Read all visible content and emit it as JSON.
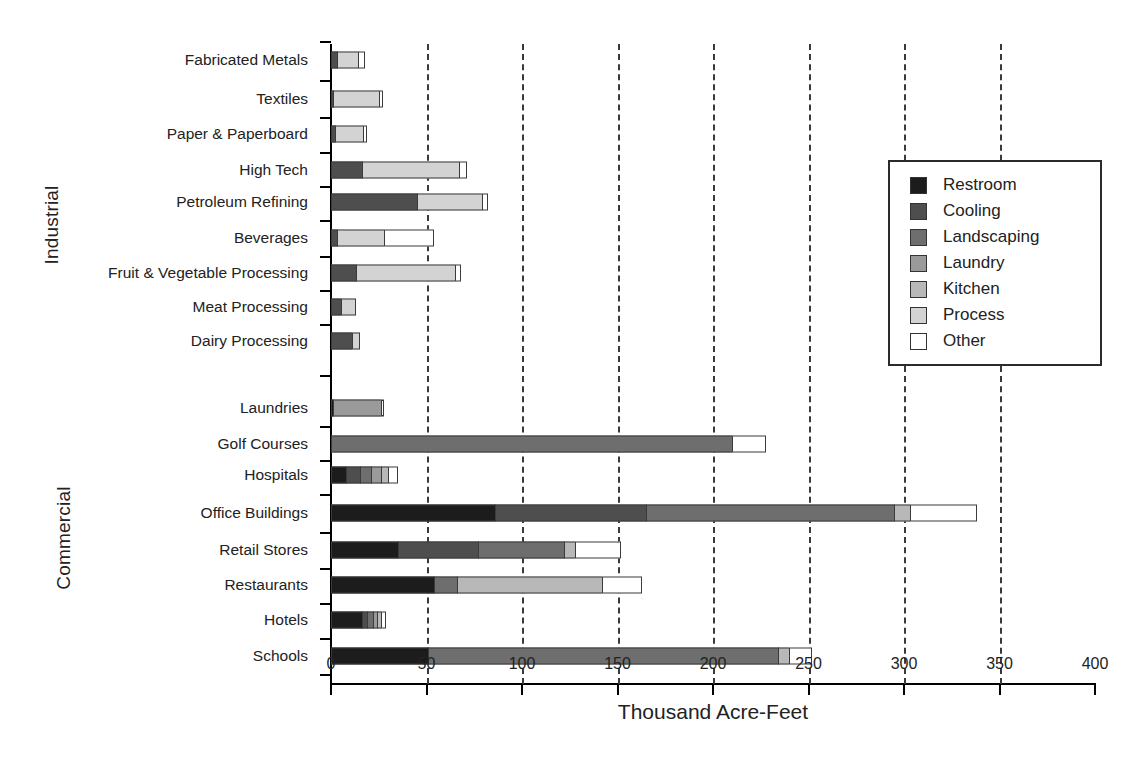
{
  "chart": {
    "type": "bar",
    "orientation": "horizontal",
    "stacked": true,
    "xlabel": "Thousand Acre-Feet",
    "ylabel": "",
    "title": "",
    "grid": "vertical-dashed",
    "legend_position": "upper-right"
  },
  "axis": {
    "x_ticks": [
      "0",
      "50",
      "100",
      "150",
      "200",
      "250",
      "300",
      "350",
      "400"
    ],
    "x_values": [
      0,
      50,
      100,
      150,
      200,
      250,
      300,
      350,
      400
    ],
    "xlim": [
      0,
      400
    ],
    "x_title": "Thousand Acre-Feet"
  },
  "groups": [
    {
      "name": "industrial",
      "label": "Industrial"
    },
    {
      "name": "commercial",
      "label": "Commercial"
    }
  ],
  "legend": {
    "items": [
      {
        "label": "Restroom",
        "color": "#1c1c1c"
      },
      {
        "label": "Cooling",
        "color": "#4e4e4e"
      },
      {
        "label": "Landscaping",
        "color": "#6e6e6e"
      },
      {
        "label": "Laundry",
        "color": "#9a9a9a"
      },
      {
        "label": "Kitchen",
        "color": "#b8b8b8"
      },
      {
        "label": "Process",
        "color": "#d3d3d3"
      },
      {
        "label": "Other",
        "color": "#ffffff"
      }
    ]
  },
  "chart_data": {
    "type": "bar",
    "orientation": "horizontal",
    "stacked": true,
    "title": "",
    "xlabel": "Thousand Acre-Feet",
    "ylabel": "",
    "xlim": [
      0,
      400
    ],
    "xticks": [
      0,
      50,
      100,
      150,
      200,
      250,
      300,
      350,
      400
    ],
    "grid": true,
    "legend_position": "upper right",
    "series": [
      {
        "name": "Restroom",
        "color": "#1c1c1c"
      },
      {
        "name": "Cooling",
        "color": "#4e4e4e"
      },
      {
        "name": "Landscaping",
        "color": "#6e6e6e"
      },
      {
        "name": "Laundry",
        "color": "#9a9a9a"
      },
      {
        "name": "Kitchen",
        "color": "#b8b8b8"
      },
      {
        "name": "Process",
        "color": "#d3d3d3"
      },
      {
        "name": "Other",
        "color": "#ffffff"
      }
    ],
    "categories": [
      "Fabricated Metals",
      "Textiles",
      "Paper & Paperboard",
      "High Tech",
      "Petroleum Refining",
      "Beverages",
      "Fruit & Vegetable Processing",
      "Meat Processing",
      "Dairy Processing",
      "Laundries",
      "Golf Courses",
      "Hospitals",
      "Office Buildings",
      "Retail Stores",
      "Restaurants",
      "Hotels",
      "Schools"
    ],
    "group_of_category": [
      "Industrial",
      "Industrial",
      "Industrial",
      "Industrial",
      "Industrial",
      "Industrial",
      "Industrial",
      "Industrial",
      "Industrial",
      "Commercial",
      "Commercial",
      "Commercial",
      "Commercial",
      "Commercial",
      "Commercial",
      "Commercial",
      "Commercial"
    ],
    "values": {
      "Fabricated Metals": {
        "Restroom": 0,
        "Cooling": 3,
        "Landscaping": 0,
        "Laundry": 0,
        "Kitchen": 0,
        "Process": 11,
        "Other": 4
      },
      "Textiles": {
        "Restroom": 0,
        "Cooling": 1,
        "Landscaping": 0,
        "Laundry": 0,
        "Kitchen": 0,
        "Process": 24,
        "Other": 2
      },
      "Paper & Paperboard": {
        "Restroom": 0,
        "Cooling": 2,
        "Landscaping": 0,
        "Laundry": 0,
        "Kitchen": 0,
        "Process": 15,
        "Other": 2
      },
      "High Tech": {
        "Restroom": 0,
        "Cooling": 16,
        "Landscaping": 0,
        "Laundry": 0,
        "Kitchen": 0,
        "Process": 51,
        "Other": 4
      },
      "Petroleum Refining": {
        "Restroom": 0,
        "Cooling": 45,
        "Landscaping": 0,
        "Laundry": 0,
        "Kitchen": 0,
        "Process": 34,
        "Other": 3
      },
      "Beverages": {
        "Restroom": 0,
        "Cooling": 3,
        "Landscaping": 0,
        "Laundry": 0,
        "Kitchen": 0,
        "Process": 25,
        "Other": 26
      },
      "Fruit & Vegetable Processing": {
        "Restroom": 0,
        "Cooling": 13,
        "Landscaping": 0,
        "Laundry": 0,
        "Kitchen": 0,
        "Process": 52,
        "Other": 3
      },
      "Meat Processing": {
        "Restroom": 0,
        "Cooling": 5,
        "Landscaping": 0,
        "Laundry": 0,
        "Kitchen": 0,
        "Process": 8,
        "Other": 0
      },
      "Dairy Processing": {
        "Restroom": 0,
        "Cooling": 11,
        "Landscaping": 0,
        "Laundry": 0,
        "Kitchen": 0,
        "Process": 4,
        "Other": 0
      },
      "Laundries": {
        "Restroom": 1,
        "Cooling": 0,
        "Landscaping": 0,
        "Laundry": 25,
        "Kitchen": 0,
        "Process": 0,
        "Other": 2
      },
      "Golf Courses": {
        "Restroom": 0,
        "Cooling": 0,
        "Landscaping": 210,
        "Laundry": 0,
        "Kitchen": 0,
        "Process": 0,
        "Other": 18
      },
      "Hospitals": {
        "Restroom": 8,
        "Cooling": 7,
        "Landscaping": 6,
        "Laundry": 5,
        "Kitchen": 4,
        "Process": 0,
        "Other": 5
      },
      "Office Buildings": {
        "Restroom": 86,
        "Cooling": 79,
        "Landscaping": 130,
        "Laundry": 0,
        "Kitchen": 8,
        "Process": 0,
        "Other": 35
      },
      "Retail Stores": {
        "Restroom": 35,
        "Cooling": 42,
        "Landscaping": 45,
        "Laundry": 0,
        "Kitchen": 6,
        "Process": 0,
        "Other": 24
      },
      "Restaurants": {
        "Restroom": 54,
        "Cooling": 0,
        "Landscaping": 12,
        "Laundry": 0,
        "Kitchen": 76,
        "Process": 0,
        "Other": 21
      },
      "Hotels": {
        "Restroom": 16,
        "Cooling": 3,
        "Landscaping": 3,
        "Laundry": 2,
        "Kitchen": 2,
        "Process": 0,
        "Other": 3
      },
      "Schools": {
        "Restroom": 51,
        "Cooling": 0,
        "Landscaping": 183,
        "Laundry": 0,
        "Kitchen": 6,
        "Process": 0,
        "Other": 12
      }
    },
    "totals": {
      "Fabricated Metals": 18,
      "Textiles": 27,
      "Paper & Paperboard": 19,
      "High Tech": 71,
      "Petroleum Refining": 82,
      "Beverages": 54,
      "Fruit & Vegetable Processing": 68,
      "Meat Processing": 13,
      "Dairy Processing": 15,
      "Laundries": 28,
      "Golf Courses": 228,
      "Hospitals": 35,
      "Office Buildings": 338,
      "Retail Stores": 152,
      "Restaurants": 163,
      "Hotels": 29,
      "Schools": 252
    }
  },
  "layout": {
    "row_y": [
      60,
      99,
      134,
      170,
      202,
      238,
      273,
      307,
      341,
      408,
      444,
      475,
      513,
      550,
      585,
      620,
      656
    ],
    "gap_rows": [
      8
    ]
  }
}
